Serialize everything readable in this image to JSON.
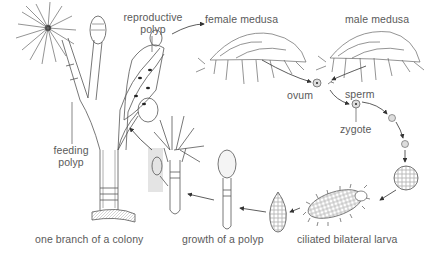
{
  "diagram": {
    "labels": {
      "reproductive_polyp_line1": "reproductive",
      "reproductive_polyp_line2": "polyp",
      "female_medusa": "female medusa",
      "male_medusa": "male medusa",
      "ovum": "ovum",
      "sperm": "sperm",
      "zygote": "zygote",
      "feeding_polyp_line1": "feeding",
      "feeding_polyp_line2": "polyp",
      "colony_branch": "one branch of a colony",
      "polyp_growth": "growth of a polyp",
      "larva": "ciliated bilateral larva"
    },
    "stages": [
      "one branch of a colony",
      "reproductive polyp",
      "female medusa",
      "male medusa",
      "ovum",
      "sperm",
      "zygote",
      "cleavage",
      "blastula",
      "ciliated bilateral larva",
      "growth of a polyp",
      "feeding polyp"
    ],
    "colors": {
      "line": "#555555",
      "text": "#5a5a5a",
      "highlight": "#e4e4e4",
      "background": "#ffffff"
    }
  }
}
